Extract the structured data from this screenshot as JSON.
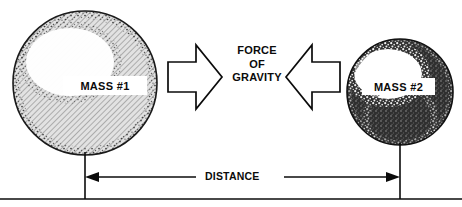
{
  "diagram": {
    "bodies": [
      {
        "id": "mass-1",
        "label": "MASS #1",
        "relative_size": "larger",
        "shading": "light hatched with stippled highlight",
        "center_x": 85,
        "center_y": 83,
        "radius": 72
      },
      {
        "id": "mass-2",
        "label": "MASS #2",
        "relative_size": "smaller",
        "shading": "dark stippled with white highlight",
        "center_x": 400,
        "center_y": 92,
        "radius": 53
      }
    ],
    "force": {
      "line1": "FORCE",
      "line2": "OF",
      "line3": "GRAVITY",
      "arrow_left_direction": "right",
      "arrow_right_direction": "left",
      "style": "outlined block arrows pointing toward each other"
    },
    "distance": {
      "label": "DISTANCE",
      "style": "double-headed dimension line with extension lines",
      "extension_left_x": 85,
      "extension_right_x": 400,
      "line_y": 177
    },
    "colors": {
      "ink": "#0b0b0b",
      "paper": "#ffffff",
      "mass1_fill": "#c9c9c9",
      "mass2_fill": "#3a3a3a",
      "highlight": "#ffffff"
    }
  }
}
